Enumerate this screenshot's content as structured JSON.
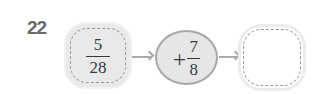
{
  "problem": {
    "number": "22",
    "start": {
      "numerator": "5",
      "denominator": "28"
    },
    "operation": {
      "sign": "+",
      "numerator": "7",
      "denominator": "8"
    },
    "result": {
      "value": ""
    }
  }
}
